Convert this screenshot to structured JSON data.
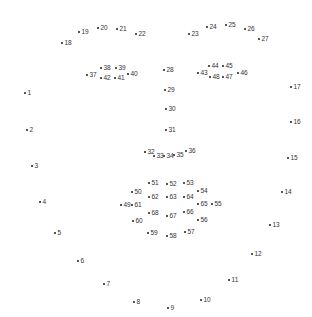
{
  "colors": {
    "background": "#ffffff",
    "dot": "#555555",
    "label": "#333333"
  },
  "points": [
    {
      "id": "1",
      "x": 24,
      "y": 93
    },
    {
      "id": "2",
      "x": 26,
      "y": 130
    },
    {
      "id": "3",
      "x": 31,
      "y": 166
    },
    {
      "id": "4",
      "x": 39,
      "y": 202
    },
    {
      "id": "5",
      "x": 54,
      "y": 233
    },
    {
      "id": "6",
      "x": 77,
      "y": 261
    },
    {
      "id": "7",
      "x": 103,
      "y": 284
    },
    {
      "id": "8",
      "x": 133,
      "y": 302
    },
    {
      "id": "9",
      "x": 167,
      "y": 308
    },
    {
      "id": "10",
      "x": 200,
      "y": 300
    },
    {
      "id": "11",
      "x": 228,
      "y": 280
    },
    {
      "id": "12",
      "x": 251,
      "y": 254
    },
    {
      "id": "13",
      "x": 269,
      "y": 225
    },
    {
      "id": "14",
      "x": 281,
      "y": 192
    },
    {
      "id": "15",
      "x": 287,
      "y": 158
    },
    {
      "id": "16",
      "x": 290,
      "y": 122
    },
    {
      "id": "17",
      "x": 290,
      "y": 87
    },
    {
      "id": "18",
      "x": 61,
      "y": 43
    },
    {
      "id": "19",
      "x": 78,
      "y": 32
    },
    {
      "id": "20",
      "x": 97,
      "y": 28
    },
    {
      "id": "21",
      "x": 116,
      "y": 29
    },
    {
      "id": "22",
      "x": 135,
      "y": 34
    },
    {
      "id": "23",
      "x": 188,
      "y": 34
    },
    {
      "id": "24",
      "x": 206,
      "y": 27
    },
    {
      "id": "25",
      "x": 225,
      "y": 25
    },
    {
      "id": "26",
      "x": 244,
      "y": 29
    },
    {
      "id": "27",
      "x": 258,
      "y": 39
    },
    {
      "id": "28",
      "x": 163,
      "y": 70
    },
    {
      "id": "29",
      "x": 164,
      "y": 90
    },
    {
      "id": "30",
      "x": 165,
      "y": 109
    },
    {
      "id": "31",
      "x": 165,
      "y": 130
    },
    {
      "id": "32",
      "x": 144,
      "y": 152
    },
    {
      "id": "33",
      "x": 153,
      "y": 156
    },
    {
      "id": "34",
      "x": 163,
      "y": 156
    },
    {
      "id": "35",
      "x": 173,
      "y": 155
    },
    {
      "id": "36",
      "x": 185,
      "y": 151
    },
    {
      "id": "37",
      "x": 86,
      "y": 75
    },
    {
      "id": "38",
      "x": 100,
      "y": 68
    },
    {
      "id": "39",
      "x": 115,
      "y": 68
    },
    {
      "id": "40",
      "x": 127,
      "y": 74
    },
    {
      "id": "41",
      "x": 114,
      "y": 78
    },
    {
      "id": "42",
      "x": 100,
      "y": 78
    },
    {
      "id": "43",
      "x": 197,
      "y": 73
    },
    {
      "id": "44",
      "x": 208,
      "y": 66
    },
    {
      "id": "45",
      "x": 222,
      "y": 66
    },
    {
      "id": "46",
      "x": 237,
      "y": 73
    },
    {
      "id": "47",
      "x": 222,
      "y": 77
    },
    {
      "id": "48",
      "x": 209,
      "y": 77
    },
    {
      "id": "49",
      "x": 120,
      "y": 205
    },
    {
      "id": "50",
      "x": 131,
      "y": 192
    },
    {
      "id": "51",
      "x": 148,
      "y": 183
    },
    {
      "id": "52",
      "x": 166,
      "y": 184
    },
    {
      "id": "53",
      "x": 183,
      "y": 183
    },
    {
      "id": "54",
      "x": 197,
      "y": 191
    },
    {
      "id": "55",
      "x": 211,
      "y": 204
    },
    {
      "id": "56",
      "x": 197,
      "y": 220
    },
    {
      "id": "57",
      "x": 184,
      "y": 232
    },
    {
      "id": "58",
      "x": 166,
      "y": 236
    },
    {
      "id": "59",
      "x": 147,
      "y": 233
    },
    {
      "id": "60",
      "x": 132,
      "y": 221
    },
    {
      "id": "61",
      "x": 131,
      "y": 205
    },
    {
      "id": "62",
      "x": 148,
      "y": 197
    },
    {
      "id": "63",
      "x": 166,
      "y": 197
    },
    {
      "id": "64",
      "x": 183,
      "y": 197
    },
    {
      "id": "65",
      "x": 197,
      "y": 204
    },
    {
      "id": "66",
      "x": 183,
      "y": 212
    },
    {
      "id": "67",
      "x": 166,
      "y": 216
    },
    {
      "id": "68",
      "x": 148,
      "y": 213
    }
  ]
}
